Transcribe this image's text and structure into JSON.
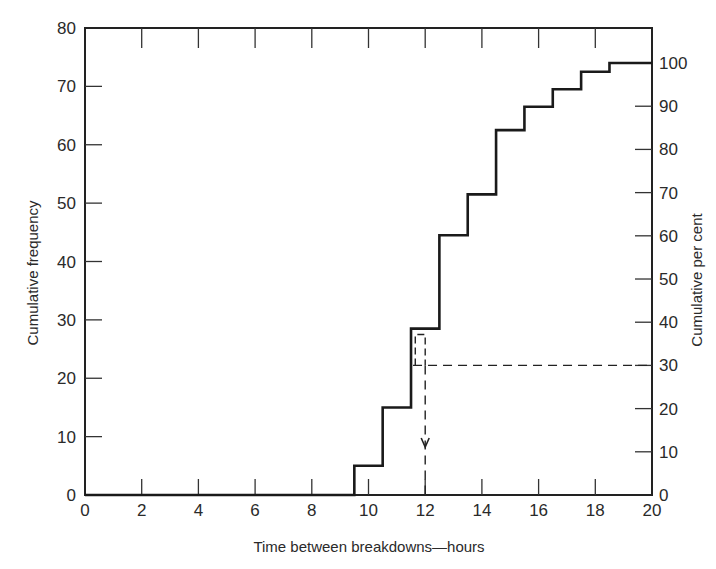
{
  "chart_data": {
    "type": "line",
    "subtype": "step (cumulative frequency ogive)",
    "title": "",
    "xlabel": "Time between breakdowns—hours",
    "ylabel": "Cumulative frequency",
    "ylabel_right": "Cumulative per cent",
    "xlim": [
      0,
      20
    ],
    "ylim": [
      0,
      80
    ],
    "ylim_right": [
      0,
      100
    ],
    "x_ticks": [
      "0",
      "2",
      "4",
      "6",
      "8",
      "10",
      "12",
      "14",
      "16",
      "18",
      "20"
    ],
    "y_ticks": [
      "0",
      "10",
      "20",
      "30",
      "40",
      "50",
      "60",
      "70",
      "80"
    ],
    "y_ticks_right": [
      "0",
      "10",
      "20",
      "30",
      "40",
      "50",
      "60",
      "70",
      "80",
      "90",
      "100"
    ],
    "grid": false,
    "series": [
      {
        "name": "Cumulative frequency",
        "style": "solid step",
        "x": [
          0,
          9.5,
          10.5,
          11.5,
          12.5,
          13.5,
          14.5,
          15.5,
          16.5,
          17.5,
          18.5,
          20
        ],
        "values": [
          0,
          5,
          15,
          28.5,
          44.5,
          51.5,
          62.5,
          66.5,
          69.5,
          72.5,
          74,
          74
        ]
      }
    ],
    "annotations": [
      {
        "type": "dashed-horizontal",
        "at_percent": 30,
        "from_x": 11.5,
        "to_x": 20,
        "note": "30% level"
      },
      {
        "type": "dashed-vertical-arrow",
        "x": 12,
        "from_percent": 30,
        "to_y": 0,
        "note": "reads off ~12 hours"
      },
      {
        "type": "dashed-bracket",
        "x_from": 11.65,
        "x_to": 12,
        "top_freq": 27.5
      }
    ]
  },
  "axes": {
    "xlabel": "Time between breakdowns—hours",
    "ylabel_left": "Cumulative frequency",
    "ylabel_right": "Cumulative per cent"
  }
}
